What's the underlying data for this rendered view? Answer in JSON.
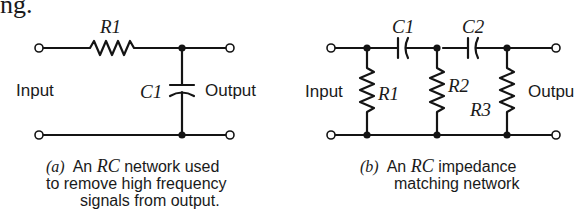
{
  "page_fragment": "ng.",
  "figure_a": {
    "labels": {
      "resistor": "R1",
      "capacitor": "C1",
      "input": "Input",
      "output": "Output"
    },
    "caption": {
      "marker": "(a)",
      "prefix": "An",
      "rc": "RC",
      "line1_rest": "network used",
      "line2": "to remove high frequency",
      "line3": "signals from output."
    }
  },
  "figure_b": {
    "labels": {
      "capacitor_1": "C1",
      "capacitor_2": "C2",
      "resistor_1": "R1",
      "resistor_2": "R2",
      "resistor_3": "R3",
      "input": "Input",
      "output": "Outpu"
    },
    "caption": {
      "marker": "(b)",
      "prefix": "An",
      "rc": "RC",
      "line1_rest": "impedance",
      "line2": "matching network"
    }
  },
  "colors": {
    "ink": "#141414",
    "background": "#ffffff"
  }
}
